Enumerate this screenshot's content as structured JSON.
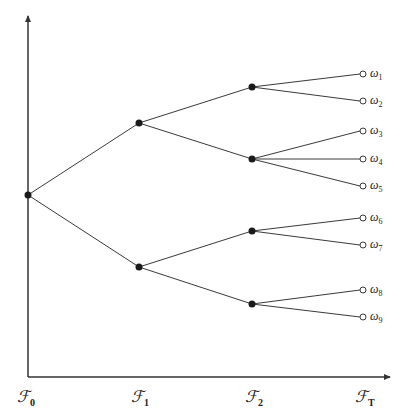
{
  "diagram": {
    "type": "event-tree / filtration tree",
    "colors": {
      "line": "#3a3a3a",
      "node": "#1a1a1a",
      "leaf_fill": "#ffffff",
      "background": "#ffffff"
    },
    "time_labels": [
      {
        "symbol": "ℱ",
        "sub": "0"
      },
      {
        "symbol": "ℱ",
        "sub": "1"
      },
      {
        "symbol": "ℱ",
        "sub": "2"
      },
      {
        "symbol": "ℱ",
        "sub": "T"
      }
    ],
    "outcomes": [
      {
        "symbol": "ω",
        "sub": "1"
      },
      {
        "symbol": "ω",
        "sub": "2"
      },
      {
        "symbol": "ω",
        "sub": "3"
      },
      {
        "symbol": "ω",
        "sub": "4"
      },
      {
        "symbol": "ω",
        "sub": "5"
      },
      {
        "symbol": "ω",
        "sub": "6"
      },
      {
        "symbol": "ω",
        "sub": "7"
      },
      {
        "symbol": "ω",
        "sub": "8"
      },
      {
        "symbol": "ω",
        "sub": "9"
      }
    ],
    "structure": {
      "root": "F0",
      "F1_nodes": [
        "upper",
        "lower"
      ],
      "F2_nodes": [
        "upper-upper",
        "upper-lower",
        "lower-upper",
        "lower-lower"
      ],
      "leaves_per_F2_node": [
        2,
        3,
        2,
        2
      ]
    }
  }
}
